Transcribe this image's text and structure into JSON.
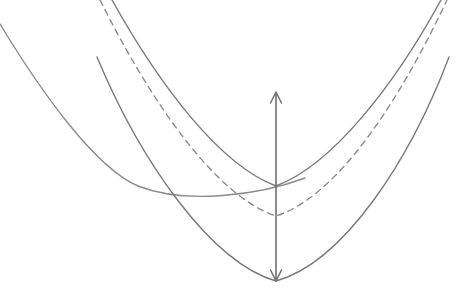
{
  "figure": {
    "title": "",
    "background_color": "#ffffff",
    "width": 470,
    "height": 301
  },
  "style": {
    "curve_color": "#7a7a7a",
    "curve_color_light": "#8c8c8c",
    "arrow_color": "#6e6e6e",
    "curve_width": 1.4,
    "arrow_width": 1.6,
    "dash_pattern": "6,5"
  },
  "chart_data": {
    "type": "line",
    "title": "",
    "xlabel": "",
    "ylabel": "",
    "xlim": [
      0,
      470
    ],
    "ylim": [
      301,
      0
    ],
    "grid": false,
    "legend": null,
    "note": "Coordinates are in pixel space with y increasing downward; curves are upward-opening parabolas (U shapes).",
    "series": [
      {
        "name": "left-curve",
        "style": "solid",
        "color": "#8c8c8c",
        "vertex": [
          138,
          186
        ],
        "x_start": 0,
        "y_start": 24,
        "x_end": 305,
        "y_end": 178,
        "path": "M 0 24 C 40 90 95 168 138 186 C 186 205 260 195 305 178"
      },
      {
        "name": "upper-solid-curve",
        "style": "solid",
        "color": "#7a7a7a",
        "vertex": [
          276,
          186
        ],
        "x_start": 112,
        "y_start": 0,
        "x_end": 441,
        "y_end": 0,
        "path": "M 112 0 C 160 86 220 165 276 186 C 332 165 394 86 441 0"
      },
      {
        "name": "dashed-curve",
        "style": "dashed",
        "color": "#8c8c8c",
        "vertex": [
          276,
          216
        ],
        "x_start": 100,
        "y_start": 0,
        "x_end": 447,
        "y_end": 0,
        "path": "M 100 0 C 150 100 215 196 276 216 C 338 196 400 100 447 0"
      },
      {
        "name": "lower-solid-curve",
        "style": "solid",
        "color": "#7a7a7a",
        "vertex": [
          276,
          281
        ],
        "x_start": 97,
        "y_start": 57,
        "x_end": 449,
        "y_end": 57,
        "path": "M 97 57 C 140 160 210 262 276 281 C 344 262 410 160 449 57"
      }
    ],
    "annotations": [
      {
        "name": "vertical-gap-arrow",
        "type": "double-headed-arrow",
        "orientation": "vertical",
        "x": 276,
        "y_top": 93,
        "y_bottom": 280,
        "length": 187,
        "label": ""
      }
    ]
  }
}
